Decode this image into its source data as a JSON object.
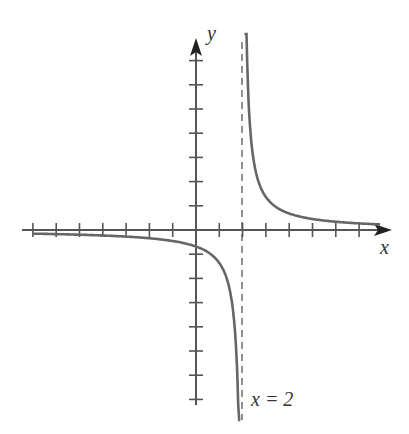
{
  "chart_data": {
    "type": "line",
    "title": "",
    "xlabel": "x",
    "ylabel": "y",
    "function": "y = 1/(x - 2)",
    "asymptote_label": "x = 2",
    "vertical_asymptote": 2,
    "horizontal_asymptote": 0,
    "xlim": [
      -7,
      8
    ],
    "ylim": [
      -7,
      8
    ],
    "grid": false,
    "x_ticks": [
      -7,
      -6,
      -5,
      -4,
      -3,
      -2,
      -1,
      1,
      2,
      3,
      4,
      5,
      6,
      7
    ],
    "y_ticks": [
      -7,
      -6,
      -5,
      -4,
      -3,
      -2,
      -1,
      1,
      2,
      3,
      4,
      5,
      6,
      7
    ],
    "series": [
      {
        "name": "left branch",
        "x": [
          -7,
          -5,
          -3,
          -1,
          0,
          1,
          1.5,
          1.8,
          1.9
        ],
        "y": [
          -0.11,
          -0.14,
          -0.2,
          -0.33,
          -0.5,
          -1,
          -2,
          -5,
          -10
        ]
      },
      {
        "name": "right branch",
        "x": [
          2.1,
          2.2,
          2.5,
          3,
          4,
          5,
          7,
          8
        ],
        "y": [
          10,
          5,
          2,
          1,
          0.5,
          0.33,
          0.2,
          0.17
        ]
      }
    ]
  },
  "labels": {
    "x_axis": "x",
    "y_axis": "y",
    "asymptote": "x = 2"
  }
}
